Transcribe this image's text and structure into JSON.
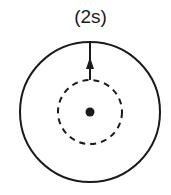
{
  "diagram": {
    "label": "(2s)",
    "outer_circle": {
      "cx": 90,
      "cy": 112,
      "r": 70,
      "style": "solid"
    },
    "inner_circle": {
      "cx": 90,
      "cy": 112,
      "r": 32,
      "style": "dashed"
    },
    "nucleus": {
      "cx": 90,
      "cy": 112,
      "r": 4
    },
    "arrow": {
      "x": 90,
      "from_y": 80,
      "to_y": 42,
      "direction": "up"
    },
    "colors": {
      "stroke": "#1a1a1a",
      "background": "#ffffff"
    }
  }
}
